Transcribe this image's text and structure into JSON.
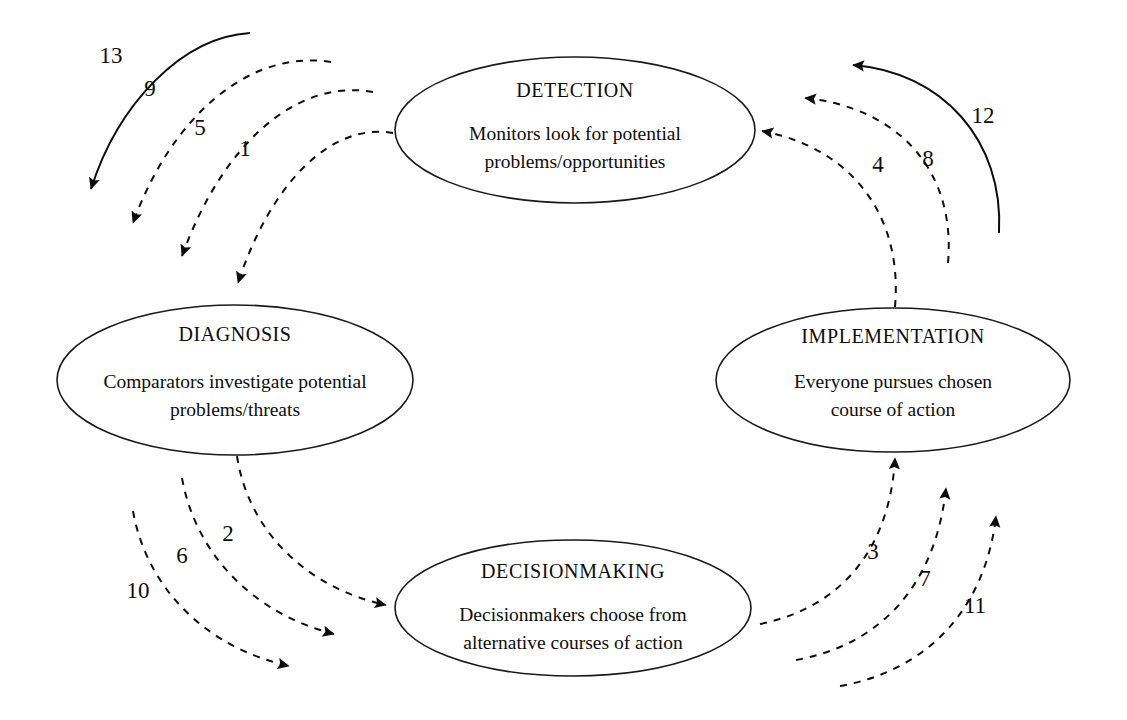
{
  "diagram": {
    "type": "cyclical-process-diagram",
    "background_color": "#ffffff",
    "line_color": "#0d0d0d",
    "nodes": [
      {
        "id": "detection",
        "title": "DETECTION",
        "desc_line1": "Monitors look for potential",
        "desc_line2": "problems/opportunities",
        "cx": 575,
        "cy": 130,
        "rx": 180,
        "ry": 73
      },
      {
        "id": "diagnosis",
        "title": "DIAGNOSIS",
        "desc_line1": "Comparators investigate potential",
        "desc_line2": "problems/threats",
        "cx": 235,
        "cy": 380,
        "rx": 178,
        "ry": 75
      },
      {
        "id": "implementation",
        "title": "IMPLEMENTATION",
        "desc_line1": "Everyone pursues chosen",
        "desc_line2": "course of action",
        "cx": 893,
        "cy": 380,
        "rx": 177,
        "ry": 72
      },
      {
        "id": "decisionmaking",
        "title": "DECISIONMAKING",
        "desc_line1": "Decisionmakers choose from",
        "desc_line2": "alternative courses of action",
        "cx": 573,
        "cy": 608,
        "rx": 178,
        "ry": 68
      }
    ],
    "arrows": [
      {
        "number": "1",
        "from": "detection",
        "to": "diagnosis",
        "style": "dashed",
        "label_x": 245,
        "label_y": 156
      },
      {
        "number": "2",
        "from": "diagnosis",
        "to": "decisionmaking",
        "style": "dashed",
        "label_x": 228,
        "label_y": 541
      },
      {
        "number": "3",
        "from": "decisionmaking",
        "to": "implementation",
        "style": "dashed",
        "label_x": 873,
        "label_y": 559
      },
      {
        "number": "4",
        "from": "implementation",
        "to": "detection",
        "style": "dashed",
        "label_x": 878,
        "label_y": 172
      },
      {
        "number": "5",
        "from": "detection",
        "to": "diagnosis",
        "style": "dashed",
        "label_x": 200,
        "label_y": 135
      },
      {
        "number": "6",
        "from": "diagnosis",
        "to": "decisionmaking",
        "style": "dashed",
        "label_x": 182,
        "label_y": 563
      },
      {
        "number": "7",
        "from": "decisionmaking",
        "to": "implementation",
        "style": "dashed",
        "label_x": 925,
        "label_y": 586
      },
      {
        "number": "8",
        "from": "implementation",
        "to": "detection",
        "style": "dashed",
        "label_x": 928,
        "label_y": 166
      },
      {
        "number": "9",
        "from": "detection",
        "to": "diagnosis",
        "style": "dashed",
        "label_x": 150,
        "label_y": 96
      },
      {
        "number": "10",
        "from": "diagnosis",
        "to": "decisionmaking",
        "style": "dashed",
        "label_x": 138,
        "label_y": 598
      },
      {
        "number": "11",
        "from": "decisionmaking",
        "to": "implementation",
        "style": "dashed",
        "label_x": 975,
        "label_y": 613
      },
      {
        "number": "12",
        "from": "implementation",
        "to": "detection",
        "style": "solid",
        "label_x": 983,
        "label_y": 123
      },
      {
        "number": "13",
        "from": "detection",
        "to": "diagnosis",
        "style": "solid",
        "label_x": 111,
        "label_y": 63
      }
    ]
  }
}
